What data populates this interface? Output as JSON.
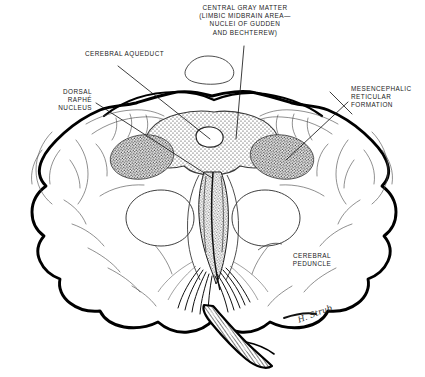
{
  "figure": {
    "signature": "H. Strub",
    "ink_color": "#000000",
    "background": "#ffffff"
  },
  "labels": [
    {
      "id": "central-gray-matter",
      "text": "CENTRAL GRAY MATTER\n(LIMBIC MIDBRAIN AREA—\nNUCLEI OF GUDDEN\nAND BECHTEREW)",
      "align": "center"
    },
    {
      "id": "cerebral-aqueduct",
      "text": "CEREBRAL AQUEDUCT",
      "align": "center"
    },
    {
      "id": "dorsal-raphe-nucleus",
      "text": "DORSAL\nRAPHÉ\nNUCLEUS",
      "align": "right"
    },
    {
      "id": "mesencephalic-reticular-formation",
      "text": "MESENCEPHALIC\nRETICULAR\nFORMATION",
      "align": "left"
    },
    {
      "id": "cerebral-peduncle",
      "text": "CEREBRAL\nPEDUNCLE",
      "align": "center"
    }
  ],
  "label_text": {
    "central_gray_matter": "CENTRAL GRAY MATTER\n(LIMBIC MIDBRAIN AREA—\nNUCLEI OF GUDDEN\nAND BECHTEREW)",
    "cerebral_aqueduct": "CEREBRAL AQUEDUCT",
    "dorsal_raphe_nucleus": "DORSAL\nRAPHÉ\nNUCLEUS",
    "mesencephalic_reticular_formation": "MESENCEPHALIC\nRETICULAR\nFORMATION",
    "cerebral_peduncle": "CEREBRAL\nPEDUNCLE",
    "signature": "H. Strub"
  }
}
